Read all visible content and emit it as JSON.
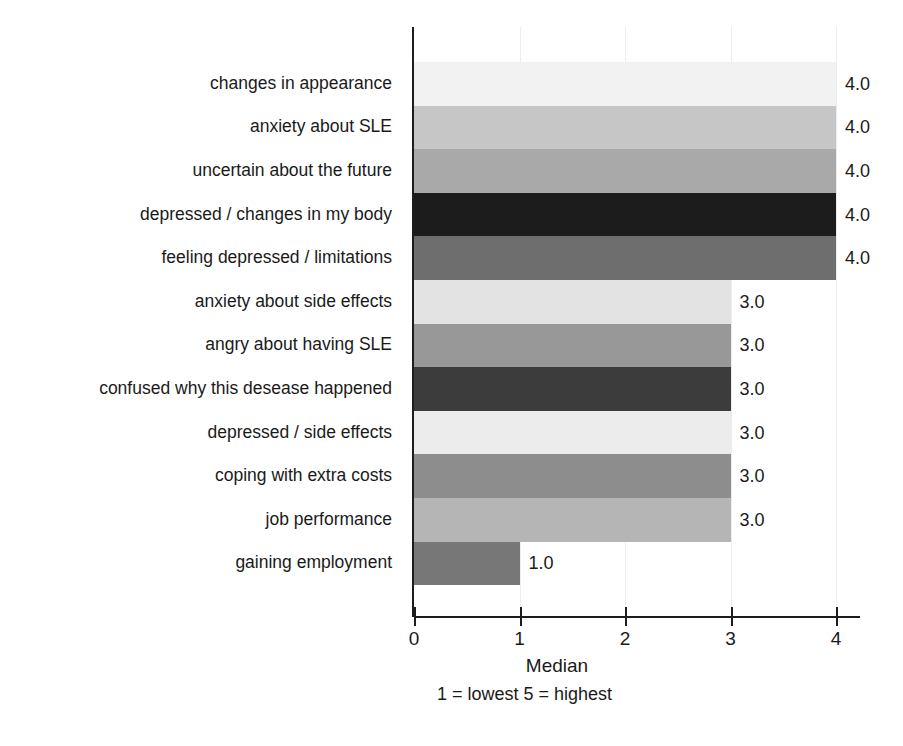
{
  "chart_data": {
    "type": "bar",
    "orientation": "horizontal",
    "title": "",
    "xlabel": "Median",
    "ylabel": "",
    "xlim": [
      0,
      4
    ],
    "grid": true,
    "legend": false,
    "note": "1 = lowest   5 = highest",
    "x_ticks": [
      "0",
      "1",
      "2",
      "3",
      "4"
    ],
    "x_tick_values": [
      0,
      1,
      2,
      3,
      4
    ],
    "categories": [
      "changes in appearance",
      "anxiety about SLE",
      "uncertain about the future",
      "depressed / changes in my body",
      "feeling depressed / limitations",
      "anxiety about side effects",
      "angry about having SLE",
      "confused why this desease happened",
      "depressed / side effects",
      "coping with extra costs",
      "job performance",
      "gaining employment"
    ],
    "values": [
      4.0,
      4.0,
      4.0,
      4.0,
      4.0,
      3.0,
      3.0,
      3.0,
      3.0,
      3.0,
      3.0,
      1.0
    ],
    "value_labels": [
      "4.0",
      "4.0",
      "4.0",
      "4.0",
      "4.0",
      "3.0",
      "3.0",
      "3.0",
      "3.0",
      "3.0",
      "3.0",
      "1.0"
    ],
    "bar_colors": [
      "#f2f2f2",
      "#c6c6c6",
      "#a9a9a9",
      "#1c1c1c",
      "#6e6e6e",
      "#e3e3e3",
      "#989898",
      "#3c3c3c",
      "#ececec",
      "#8d8d8d",
      "#b5b5b5",
      "#777777"
    ],
    "axis_color": "#1d1d1d",
    "grid_color": "#ededed",
    "background": "#ffffff"
  }
}
